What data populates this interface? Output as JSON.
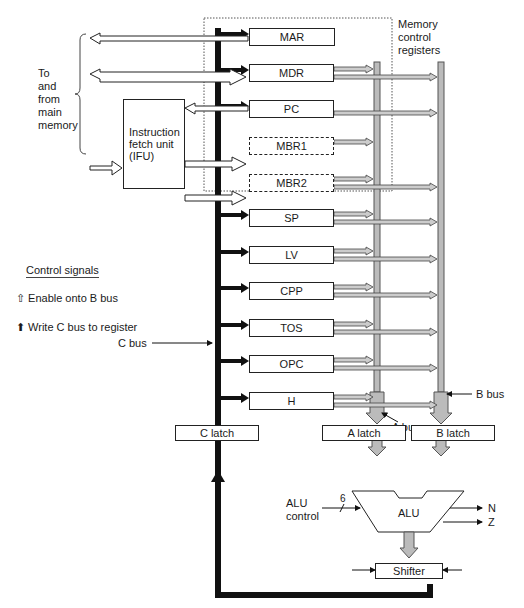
{
  "labels": {
    "memory_control_registers": [
      "Memory",
      "control",
      "registers"
    ],
    "to_from_memory": [
      "To",
      "and",
      "from",
      "main",
      "memory"
    ],
    "ifu": [
      "Instruction",
      "fetch unit",
      "(IFU)"
    ],
    "c_bus": "C bus",
    "b_bus": "B bus",
    "a_bus": "A bus",
    "alu_control": [
      "ALU",
      "control"
    ],
    "alu_control_width": "6",
    "alu": "ALU",
    "flag_n": "N",
    "flag_z": "Z"
  },
  "legend": {
    "title": "Control signals",
    "items": [
      {
        "icon": "hollow-arrow-up",
        "label": "Enable onto B bus"
      },
      {
        "icon": "solid-arrow-up",
        "label": "Write C bus to register"
      }
    ]
  },
  "registers": [
    {
      "name": "MAR",
      "y": 28
    },
    {
      "name": "MDR",
      "y": 64
    },
    {
      "name": "PC",
      "y": 100
    },
    {
      "name": "MBR1",
      "y": 137
    },
    {
      "name": "MBR2",
      "y": 174
    },
    {
      "name": "SP",
      "y": 209
    },
    {
      "name": "LV",
      "y": 246
    },
    {
      "name": "CPP",
      "y": 282
    },
    {
      "name": "TOS",
      "y": 319
    },
    {
      "name": "OPC",
      "y": 355
    },
    {
      "name": "H",
      "y": 392
    }
  ],
  "latches": {
    "c": "C latch",
    "a": "A latch",
    "b": "B latch",
    "shifter": "Shifter"
  }
}
